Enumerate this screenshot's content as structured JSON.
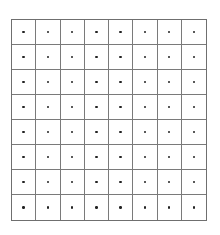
{
  "grid": {
    "rows": 8,
    "columns": 8,
    "line_color": "#7a7a7a",
    "border_color": "#6f6f6f",
    "dot_color": "#222222",
    "background": "#ffffff",
    "dot_in_every_cell": true
  }
}
